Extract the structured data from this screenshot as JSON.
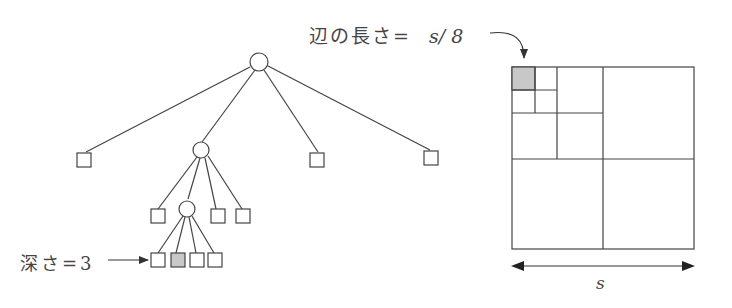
{
  "labels": {
    "edge_length_prefix": "辺の長さ=",
    "edge_length_value": "s/ 8",
    "depth_label": "深さ=3",
    "side_label": "s"
  },
  "colors": {
    "stroke": "#444444",
    "highlight_fill": "#c8c8c8",
    "background": "#ffffff"
  },
  "tree": {
    "root": {
      "type": "circle",
      "children": [
        "leaf",
        "internal",
        "leaf",
        "leaf"
      ]
    },
    "level1_internal": {
      "type": "circle",
      "children": [
        "leaf",
        "internal",
        "leaf",
        "leaf"
      ]
    },
    "level2_internal": {
      "type": "circle",
      "children": [
        "leaf",
        "leaf-highlighted",
        "leaf",
        "leaf"
      ]
    },
    "depth_indicated": 3
  },
  "quadtree_grid": {
    "side": "s",
    "highlighted_cell_side": "s/8",
    "subdivision": "top-left quadrant subdivided twice"
  }
}
